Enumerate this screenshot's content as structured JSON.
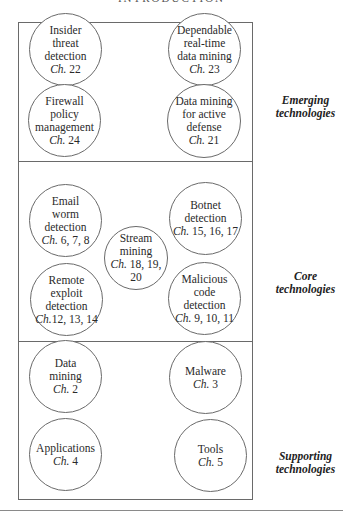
{
  "header": {
    "title": "INTRODUCTION"
  },
  "layers": [
    {
      "label_line1": "Emerging",
      "label_line2": "technologies",
      "nodes": [
        {
          "lines": [
            "Insider",
            "threat",
            "detection"
          ],
          "ch_prefix": "Ch.",
          "ch_nums": " 22"
        },
        {
          "lines": [
            "Dependable",
            "real-time",
            "data mining"
          ],
          "ch_prefix": "Ch.",
          "ch_nums": " 23"
        },
        {
          "lines": [
            "Firewall",
            "policy",
            "management"
          ],
          "ch_prefix": "Ch.",
          "ch_nums": " 24"
        },
        {
          "lines": [
            "Data mining",
            "for active",
            "defense"
          ],
          "ch_prefix": "Ch.",
          "ch_nums": " 21"
        }
      ]
    },
    {
      "label_line1": "Core",
      "label_line2": "technologies",
      "nodes": [
        {
          "lines": [
            "Email",
            "worm",
            "detection"
          ],
          "ch_prefix": "Ch.",
          "ch_nums": " 6, 7, 8"
        },
        {
          "lines": [
            "Botnet",
            "detection"
          ],
          "ch_prefix": "Ch.",
          "ch_nums": " 15, 16, 17"
        },
        {
          "lines": [
            "Stream",
            "mining"
          ],
          "ch_prefix": "Ch.",
          "ch_nums": " 18, 19, 20"
        },
        {
          "lines": [
            "Remote",
            "exploit",
            "detection"
          ],
          "ch_prefix": "Ch.",
          "ch_nums": "12, 13, 14"
        },
        {
          "lines": [
            "Malicious",
            "code",
            "detection"
          ],
          "ch_prefix": "Ch.",
          "ch_nums": " 9, 10, 11"
        }
      ]
    },
    {
      "label_line1": "Supporting",
      "label_line2": "technologies",
      "nodes": [
        {
          "lines": [
            "Data",
            "mining"
          ],
          "ch_prefix": "Ch.",
          "ch_nums": " 2"
        },
        {
          "lines": [
            "Malware"
          ],
          "ch_prefix": "Ch.",
          "ch_nums": " 3"
        },
        {
          "lines": [
            "Applications"
          ],
          "ch_prefix": "Ch.",
          "ch_nums": " 4"
        },
        {
          "lines": [
            "Tools"
          ],
          "ch_prefix": "Ch.",
          "ch_nums": " 5"
        }
      ]
    }
  ]
}
